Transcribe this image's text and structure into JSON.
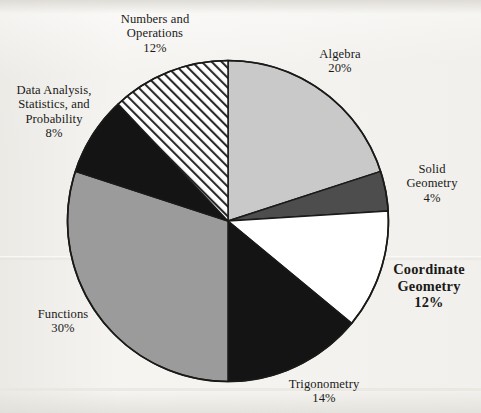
{
  "chart_data": {
    "type": "pie",
    "title": "",
    "subtitle": "",
    "xlabel": "",
    "ylabel": "",
    "legend_position": "labels-around-pie",
    "grid": false,
    "start_angle_deg": -90,
    "direction": "clockwise",
    "units": "percent",
    "categories": [
      "Algebra",
      "Solid Geometry",
      "Coordinate Geometry",
      "Trigonometry",
      "Functions",
      "Data Analysis, Statistics, and Probability",
      "Numbers and Operations"
    ],
    "values": [
      20,
      4,
      12,
      14,
      30,
      8,
      12
    ],
    "slices": [
      {
        "id": "algebra",
        "label_lines": [
          "Algebra"
        ],
        "value": 20,
        "pct_text": "20%",
        "fill": "#c9c9c9",
        "pattern": "solid",
        "emphasis": false
      },
      {
        "id": "solid-geometry",
        "label_lines": [
          "Solid",
          "Geometry"
        ],
        "value": 4,
        "pct_text": "4%",
        "fill": "#4d4d4d",
        "pattern": "solid",
        "emphasis": false
      },
      {
        "id": "coordinate-geometry",
        "label_lines": [
          "Coordinate",
          "Geometry"
        ],
        "value": 12,
        "pct_text": "12%",
        "fill": "#ffffff",
        "pattern": "solid",
        "emphasis": true
      },
      {
        "id": "trigonometry",
        "label_lines": [
          "Trigonometry"
        ],
        "value": 14,
        "pct_text": "14%",
        "fill": "#141414",
        "pattern": "solid",
        "emphasis": false
      },
      {
        "id": "functions",
        "label_lines": [
          "Functions"
        ],
        "value": 30,
        "pct_text": "30%",
        "fill": "#9b9b9b",
        "pattern": "solid",
        "emphasis": false
      },
      {
        "id": "data-analysis",
        "label_lines": [
          "Data Analysis,",
          "Statistics, and",
          "Probability"
        ],
        "value": 8,
        "pct_text": "8%",
        "fill": "#141414",
        "pattern": "solid",
        "emphasis": false
      },
      {
        "id": "numbers-operations",
        "label_lines": [
          "Numbers and",
          "Operations"
        ],
        "value": 12,
        "pct_text": "12%",
        "fill": "#ffffff",
        "pattern": "diagonal-hatch",
        "emphasis": false
      }
    ]
  },
  "labels": {
    "numbers_operations": {
      "line1": "Numbers and",
      "line2": "Operations",
      "pct": "12%"
    },
    "data_analysis": {
      "line1": "Data Analysis,",
      "line2": "Statistics, and",
      "line3": "Probability",
      "pct": "8%"
    },
    "algebra": {
      "line1": "Algebra",
      "pct": "20%"
    },
    "solid_geometry": {
      "line1": "Solid",
      "line2": "Geometry",
      "pct": "4%"
    },
    "coordinate_geometry": {
      "line1": "Coordinate",
      "line2": "Geometry",
      "pct": "12%"
    },
    "trigonometry": {
      "line1": "Trigonometry",
      "pct": "14%"
    },
    "functions": {
      "line1": "Functions",
      "pct": "30%"
    }
  },
  "colors": {
    "page_background": "#f4f3f0",
    "outline": "#1a1a18",
    "text": "#1a1a18",
    "light_gray": "#c9c9c9",
    "medium_gray": "#9b9b9b",
    "dark_gray": "#4d4d4d",
    "black": "#141414",
    "white": "#ffffff"
  }
}
